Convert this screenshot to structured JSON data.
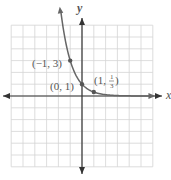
{
  "chart_data": {
    "type": "line",
    "title": "",
    "xlabel": "x",
    "ylabel": "y",
    "xlim": [
      -6,
      6
    ],
    "ylim": [
      -6,
      6
    ],
    "grid": true,
    "function": "y = (1/3)^x",
    "series": [
      {
        "name": "y = (1/3)^x",
        "x": [
          -1.8,
          -1.5,
          -1,
          -0.5,
          0,
          0.5,
          1,
          2,
          3,
          4,
          5
        ],
        "y": [
          7.2,
          5.2,
          3,
          1.73,
          1,
          0.577,
          0.333,
          0.111,
          0.037,
          0.012,
          0.004
        ]
      }
    ],
    "points": [
      {
        "x": -1,
        "y": 3,
        "label": "(−1, 3)"
      },
      {
        "x": 0,
        "y": 1,
        "label": "(0, 1)"
      },
      {
        "x": 1,
        "y": 0.3333,
        "label_prefix": "(1, ",
        "label_num": "1",
        "label_den": "3",
        "label_suffix": ")"
      }
    ]
  }
}
